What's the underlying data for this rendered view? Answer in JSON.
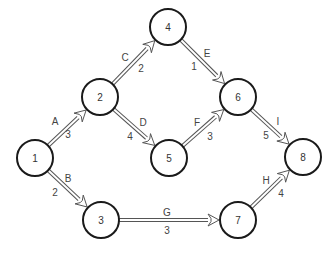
{
  "diagram": {
    "type": "activity-on-arrow network",
    "node_radius": 18,
    "nodes": [
      {
        "id": "1",
        "label": "1",
        "x": 35,
        "y": 158
      },
      {
        "id": "2",
        "label": "2",
        "x": 100,
        "y": 97
      },
      {
        "id": "3",
        "label": "3",
        "x": 101,
        "y": 220
      },
      {
        "id": "4",
        "label": "4",
        "x": 168,
        "y": 27
      },
      {
        "id": "5",
        "label": "5",
        "x": 169,
        "y": 158
      },
      {
        "id": "6",
        "label": "6",
        "x": 238,
        "y": 97
      },
      {
        "id": "7",
        "label": "7",
        "x": 238,
        "y": 220
      },
      {
        "id": "8",
        "label": "8",
        "x": 303,
        "y": 157
      }
    ],
    "edges": [
      {
        "activity": "A",
        "duration": "3",
        "from": "1",
        "to": "2",
        "name_pos": [
          55,
          121
        ],
        "dur_pos": [
          68,
          134
        ]
      },
      {
        "activity": "B",
        "duration": "2",
        "from": "1",
        "to": "3",
        "name_pos": [
          68,
          178
        ],
        "dur_pos": [
          55,
          192
        ]
      },
      {
        "activity": "C",
        "duration": "2",
        "from": "2",
        "to": "4",
        "name_pos": [
          125,
          57
        ],
        "dur_pos": [
          141,
          68
        ]
      },
      {
        "activity": "D",
        "duration": "4",
        "from": "2",
        "to": "5",
        "name_pos": [
          143,
          122
        ],
        "dur_pos": [
          130,
          136
        ]
      },
      {
        "activity": "E",
        "duration": "1",
        "from": "4",
        "to": "6",
        "name_pos": [
          207,
          53
        ],
        "dur_pos": [
          194,
          66
        ]
      },
      {
        "activity": "F",
        "duration": "3",
        "from": "5",
        "to": "6",
        "name_pos": [
          197,
          122
        ],
        "dur_pos": [
          210,
          136
        ]
      },
      {
        "activity": "G",
        "duration": "3",
        "from": "3",
        "to": "7",
        "name_pos": [
          167,
          212
        ],
        "dur_pos": [
          167,
          230
        ]
      },
      {
        "activity": "H",
        "duration": "4",
        "from": "7",
        "to": "8",
        "name_pos": [
          266,
          180
        ],
        "dur_pos": [
          281,
          193
        ]
      },
      {
        "activity": "I",
        "duration": "5",
        "from": "6",
        "to": "8",
        "name_pos": [
          278,
          121
        ],
        "dur_pos": [
          266,
          135
        ]
      }
    ]
  }
}
